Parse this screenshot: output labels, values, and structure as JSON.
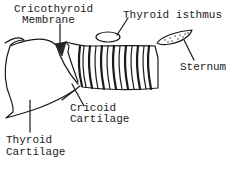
{
  "diagram": {
    "labels": {
      "cricothyroid_membrane": {
        "line1": "Cricothyroid",
        "line2": "Membrane"
      },
      "thyroid_isthmus": {
        "line1": "Thyroid isthmus"
      },
      "sternum": {
        "line1": "Sternum"
      },
      "cricoid_cartilage": {
        "line1": "Cricoid",
        "line2": "Cartilage"
      },
      "thyroid_cartilage": {
        "line1": "Thyroid",
        "line2": "Cartilage"
      }
    },
    "colors": {
      "ink": "#1a1a1a",
      "background": "#ffffff",
      "text": "#222222"
    }
  }
}
